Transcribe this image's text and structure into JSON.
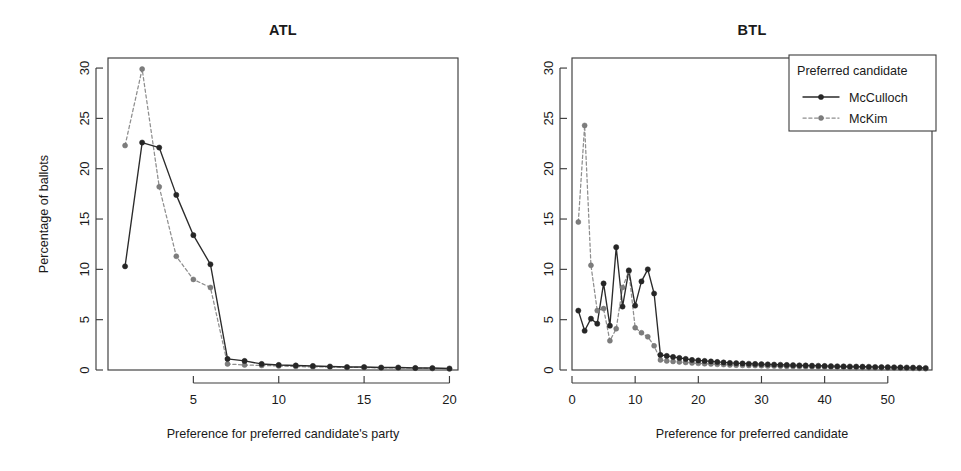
{
  "figure": {
    "width": 961,
    "height": 471,
    "background": "#ffffff",
    "series_colors": {
      "mcculloch": "#262626",
      "mckim": "#8e8e8e"
    }
  },
  "legend": {
    "title": "Preferred candidate",
    "entries": [
      {
        "label": "McCulloch",
        "style": "solid",
        "color": "#262626"
      },
      {
        "label": "McKim",
        "style": "dashed",
        "color": "#8e8e8e"
      }
    ],
    "position": "top-right of BTL panel"
  },
  "chart_data": [
    {
      "type": "line",
      "panel": "left",
      "title": "ATL",
      "xlabel": "Preference for preferred candidate's party",
      "ylabel": "Percentage of ballots",
      "xlim": [
        0,
        20.5
      ],
      "ylim": [
        0,
        31
      ],
      "xticks": [
        5,
        10,
        15,
        20
      ],
      "yticks": [
        0,
        5,
        10,
        15,
        20,
        25,
        30
      ],
      "xtick_labels": [
        "5",
        "10",
        "15",
        "20"
      ],
      "ytick_labels": [
        "0",
        "5",
        "10",
        "15",
        "20",
        "25",
        "30"
      ],
      "grid": false,
      "legend": false,
      "x": [
        1,
        2,
        3,
        4,
        5,
        6,
        7,
        8,
        9,
        10,
        11,
        12,
        13,
        14,
        15,
        16,
        17,
        18,
        19,
        20
      ],
      "series": [
        {
          "name": "McCulloch",
          "style": "solid",
          "color": "#262626",
          "values": [
            10.3,
            22.6,
            22.1,
            17.4,
            13.4,
            10.5,
            1.1,
            0.9,
            0.6,
            0.5,
            0.45,
            0.4,
            0.35,
            0.3,
            0.3,
            0.25,
            0.25,
            0.2,
            0.2,
            0.15
          ]
        },
        {
          "name": "McKim",
          "style": "dashed",
          "color": "#8e8e8e",
          "values": [
            22.3,
            29.9,
            18.2,
            11.3,
            9.0,
            8.2,
            0.6,
            0.5,
            0.45,
            0.4,
            0.35,
            0.3,
            0.3,
            0.25,
            0.25,
            0.2,
            0.2,
            0.2,
            0.15,
            0.1
          ]
        }
      ]
    },
    {
      "type": "line",
      "panel": "right",
      "title": "BTL",
      "xlabel": "Preference for preferred candidate",
      "ylabel": "",
      "xlim": [
        0,
        57
      ],
      "ylim": [
        0,
        31
      ],
      "xticks": [
        0,
        10,
        20,
        30,
        40,
        50
      ],
      "yticks": [
        0,
        5,
        10,
        15,
        20,
        25,
        30
      ],
      "xtick_labels": [
        "0",
        "10",
        "20",
        "30",
        "40",
        "50"
      ],
      "ytick_labels": [
        "0",
        "5",
        "10",
        "15",
        "20",
        "25",
        "30"
      ],
      "grid": false,
      "legend": true,
      "x": [
        1,
        2,
        3,
        4,
        5,
        6,
        7,
        8,
        9,
        10,
        11,
        12,
        13,
        14,
        15,
        16,
        17,
        18,
        19,
        20,
        21,
        22,
        23,
        24,
        25,
        26,
        27,
        28,
        29,
        30,
        31,
        32,
        33,
        34,
        35,
        36,
        37,
        38,
        39,
        40,
        41,
        42,
        43,
        44,
        45,
        46,
        47,
        48,
        49,
        50,
        51,
        52,
        53,
        54,
        55,
        56
      ],
      "series": [
        {
          "name": "McCulloch",
          "style": "solid",
          "color": "#262626",
          "values": [
            5.9,
            3.9,
            5.1,
            4.6,
            8.6,
            4.4,
            12.2,
            6.3,
            9.9,
            6.4,
            8.8,
            10.0,
            7.6,
            1.5,
            1.4,
            1.3,
            1.2,
            1.1,
            1.0,
            0.95,
            0.9,
            0.85,
            0.8,
            0.75,
            0.7,
            0.68,
            0.65,
            0.62,
            0.6,
            0.58,
            0.56,
            0.54,
            0.52,
            0.5,
            0.48,
            0.46,
            0.45,
            0.43,
            0.42,
            0.4,
            0.38,
            0.37,
            0.36,
            0.35,
            0.34,
            0.33,
            0.32,
            0.3,
            0.29,
            0.28,
            0.27,
            0.26,
            0.25,
            0.24,
            0.22,
            0.2
          ]
        },
        {
          "name": "McKim",
          "style": "dashed",
          "color": "#8e8e8e",
          "values": [
            14.7,
            24.3,
            10.4,
            5.9,
            6.1,
            2.9,
            4.1,
            8.2,
            9.8,
            4.2,
            3.7,
            3.3,
            2.4,
            1.0,
            0.9,
            0.85,
            0.8,
            0.75,
            0.7,
            0.66,
            0.62,
            0.6,
            0.56,
            0.54,
            0.5,
            0.48,
            0.46,
            0.45,
            0.44,
            0.42,
            0.4,
            0.39,
            0.38,
            0.36,
            0.35,
            0.34,
            0.33,
            0.32,
            0.31,
            0.3,
            0.29,
            0.28,
            0.27,
            0.26,
            0.25,
            0.24,
            0.23,
            0.22,
            0.21,
            0.2,
            0.19,
            0.18,
            0.17,
            0.16,
            0.15,
            0.13
          ]
        }
      ]
    }
  ]
}
